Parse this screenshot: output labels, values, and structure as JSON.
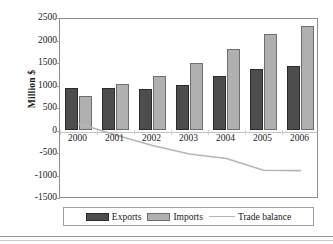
{
  "chart_data": {
    "type": "bar",
    "title": "",
    "subtitle": "",
    "xlabel": "",
    "ylabel": "Million $",
    "categories": [
      "2000",
      "2001",
      "2002",
      "2003",
      "2004",
      "2005",
      "2006"
    ],
    "series": [
      {
        "name": "Exports",
        "type": "bar",
        "color": "#4d4d4d",
        "values": [
          920,
          930,
          890,
          980,
          1190,
          1340,
          1410
        ]
      },
      {
        "name": "Imports",
        "type": "bar",
        "color": "#b0b0b0",
        "values": [
          740,
          1010,
          1200,
          1480,
          1790,
          2120,
          2300
        ]
      },
      {
        "name": "Trade balance",
        "type": "line",
        "color": "#b5b5b5",
        "values": [
          180,
          -80,
          -310,
          -500,
          -600,
          -860,
          -870
        ]
      }
    ],
    "ylim": [
      -1500,
      2500
    ],
    "ytick_step": 500,
    "yticks": [
      2500,
      2000,
      1500,
      1000,
      500,
      0,
      -500,
      -1000,
      -1500
    ],
    "ytick_labels": [
      "2500",
      "2000",
      "1500",
      "1000",
      "500",
      "0",
      "-500",
      "-1000",
      "-1500"
    ],
    "grid": false,
    "zero_line": true,
    "legend_position": "bottom",
    "legend_entries": [
      "Exports",
      "Imports",
      "Trade balance"
    ]
  },
  "legend": {
    "exports_label": "Exports",
    "imports_label": "Imports",
    "balance_label": "Trade balance"
  },
  "axis": {
    "y_title": "Million $"
  }
}
